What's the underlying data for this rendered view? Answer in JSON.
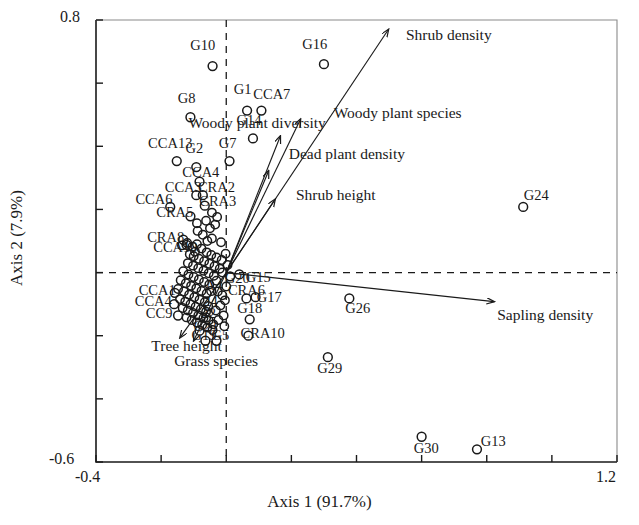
{
  "figure": {
    "type": "ordination-biplot",
    "background": "#ffffff",
    "ink": "#1a1a1a"
  },
  "axes": {
    "x": {
      "title": "Axis 1 (91.7%)",
      "min_label": "-0.4",
      "max_label": "1.2",
      "min": -0.4,
      "max": 1.2,
      "tick_step": 0.2,
      "ticks": [
        -0.4,
        -0.2,
        0.0,
        0.2,
        0.4,
        0.6,
        0.8,
        1.0,
        1.2
      ]
    },
    "y": {
      "title": "Axis 2 (7.9%)",
      "min_label": "-0.6",
      "max_label": "0.8",
      "min": -0.6,
      "max": 0.8,
      "tick_step": 0.2,
      "ticks": [
        -0.6,
        -0.4,
        -0.2,
        0.0,
        0.2,
        0.4,
        0.6,
        0.8
      ]
    },
    "reference_lines": {
      "vertical_at_x": 0.0,
      "horizontal_at_y": 0.0,
      "style": "dashed"
    }
  },
  "chart_data": {
    "type": "scatter",
    "title": "",
    "xlabel": "Axis 1 (91.7%)",
    "ylabel": "Axis 2 (7.9%)",
    "xlim": [
      -0.4,
      1.2
    ],
    "ylim": [
      -0.6,
      0.8
    ],
    "grid": false,
    "legend": "none",
    "marker": "open-circle",
    "points": [
      {
        "label": "G10",
        "x": -0.042,
        "y": 0.654,
        "lx": -0.072,
        "ly": 0.714,
        "anchor": "middle"
      },
      {
        "label": "G1",
        "x": 0.064,
        "y": 0.513,
        "lx": 0.05,
        "ly": 0.576,
        "anchor": "middle"
      },
      {
        "label": "CCA7",
        "x": 0.108,
        "y": 0.513,
        "lx": 0.14,
        "ly": 0.56,
        "anchor": "middle"
      },
      {
        "label": "G8",
        "x": -0.11,
        "y": 0.492,
        "lx": -0.122,
        "ly": 0.548,
        "anchor": "middle"
      },
      {
        "label": "G14",
        "x": 0.082,
        "y": 0.425,
        "lx": 0.07,
        "ly": 0.478,
        "anchor": "middle"
      },
      {
        "label": "G7",
        "x": 0.01,
        "y": 0.353,
        "lx": 0.004,
        "ly": 0.406,
        "anchor": "middle"
      },
      {
        "label": "CCA13",
        "x": -0.152,
        "y": 0.353,
        "lx": -0.172,
        "ly": 0.406,
        "anchor": "middle"
      },
      {
        "label": "G2",
        "x": -0.092,
        "y": 0.334,
        "lx": -0.098,
        "ly": 0.388,
        "anchor": "middle"
      },
      {
        "label": "CCA4",
        "x": -0.082,
        "y": 0.288,
        "lx": -0.078,
        "ly": 0.312,
        "anchor": "middle"
      },
      {
        "label": "CCA3",
        "x": -0.092,
        "y": 0.245,
        "lx": -0.132,
        "ly": 0.266,
        "anchor": "middle"
      },
      {
        "label": "CRA2",
        "x": -0.072,
        "y": 0.245,
        "lx": -0.03,
        "ly": 0.266,
        "anchor": "middle"
      },
      {
        "label": "CCA6",
        "x": -0.172,
        "y": 0.208,
        "lx": -0.222,
        "ly": 0.228,
        "anchor": "middle"
      },
      {
        "label": "CRA3",
        "x": -0.066,
        "y": 0.212,
        "lx": -0.026,
        "ly": 0.222,
        "anchor": "middle"
      },
      {
        "label": "CRA5",
        "x": -0.11,
        "y": 0.178,
        "lx": -0.158,
        "ly": 0.186,
        "anchor": "middle"
      },
      {
        "label": "CRA8",
        "x": -0.132,
        "y": 0.104,
        "lx": -0.186,
        "ly": 0.106,
        "anchor": "middle"
      },
      {
        "label": "CCA10",
        "x": -0.122,
        "y": 0.088,
        "lx": -0.156,
        "ly": 0.076,
        "anchor": "middle"
      },
      {
        "label": "G16",
        "x": 0.3,
        "y": 0.66,
        "lx": 0.272,
        "ly": 0.718,
        "anchor": "middle"
      },
      {
        "label": "G24",
        "x": 0.912,
        "y": 0.208,
        "lx": 0.952,
        "ly": 0.24,
        "anchor": "middle"
      },
      {
        "label": "G20",
        "x": 0.012,
        "y": -0.012,
        "lx": 0.034,
        "ly": -0.022,
        "anchor": "middle"
      },
      {
        "label": "G15",
        "x": 0.04,
        "y": -0.006,
        "lx": 0.098,
        "ly": -0.02,
        "anchor": "middle"
      },
      {
        "label": "CRA6",
        "x": 0.062,
        "y": -0.082,
        "lx": 0.062,
        "ly": -0.062,
        "anchor": "middle"
      },
      {
        "label": "G17",
        "x": 0.09,
        "y": -0.078,
        "lx": 0.132,
        "ly": -0.082,
        "anchor": "middle"
      },
      {
        "label": "G18",
        "x": 0.072,
        "y": -0.148,
        "lx": 0.072,
        "ly": -0.118,
        "anchor": "middle"
      },
      {
        "label": "CRA10",
        "x": 0.068,
        "y": -0.2,
        "lx": 0.112,
        "ly": -0.198,
        "anchor": "middle"
      },
      {
        "label": "G26",
        "x": 0.378,
        "y": -0.082,
        "lx": 0.404,
        "ly": -0.118,
        "anchor": "middle"
      },
      {
        "label": "G29",
        "x": 0.312,
        "y": -0.268,
        "lx": 0.318,
        "ly": -0.306,
        "anchor": "middle"
      },
      {
        "label": "G30",
        "x": 0.6,
        "y": -0.52,
        "lx": 0.614,
        "ly": -0.562,
        "anchor": "middle"
      },
      {
        "label": "G13",
        "x": 0.77,
        "y": -0.56,
        "lx": 0.82,
        "ly": -0.538,
        "anchor": "middle"
      },
      {
        "label": "CCA1",
        "x": -0.158,
        "y": -0.064,
        "lx": -0.212,
        "ly": -0.06,
        "anchor": "middle"
      },
      {
        "label": "CCA4b",
        "x": -0.16,
        "y": -0.1,
        "lx": -0.224,
        "ly": -0.096,
        "anchor": "middle"
      },
      {
        "label": "CC9",
        "x": -0.148,
        "y": -0.136,
        "lx": -0.206,
        "ly": -0.132,
        "anchor": "middle"
      },
      {
        "label": "A4",
        "x": -0.046,
        "y": -0.058,
        "lx": -0.038,
        "ly": -0.046,
        "anchor": "middle"
      },
      {
        "label": "24",
        "x": -0.056,
        "y": -0.106,
        "lx": -0.048,
        "ly": -0.096,
        "anchor": "middle"
      },
      {
        "label": "22",
        "x": -0.062,
        "y": -0.142,
        "lx": -0.054,
        "ly": -0.134,
        "anchor": "middle"
      },
      {
        "label": "G21",
        "x": -0.082,
        "y": -0.184,
        "lx": -0.062,
        "ly": -0.176,
        "anchor": "middle"
      },
      {
        "label": "G19",
        "x": -0.064,
        "y": -0.216,
        "lx": -0.068,
        "ly": -0.204,
        "anchor": "middle"
      },
      {
        "label": "G5",
        "x": -0.03,
        "y": -0.216,
        "lx": -0.018,
        "ly": -0.204,
        "anchor": "middle"
      }
    ],
    "cluster_points": [
      {
        "x": -0.136,
        "y": 0.086
      },
      {
        "x": -0.12,
        "y": 0.094
      },
      {
        "x": -0.104,
        "y": 0.082
      },
      {
        "x": -0.09,
        "y": 0.09
      },
      {
        "x": -0.076,
        "y": 0.076
      },
      {
        "x": -0.06,
        "y": 0.064
      },
      {
        "x": -0.046,
        "y": 0.056
      },
      {
        "x": -0.03,
        "y": 0.048
      },
      {
        "x": -0.014,
        "y": 0.04
      },
      {
        "x": -0.1,
        "y": 0.052
      },
      {
        "x": -0.084,
        "y": 0.044
      },
      {
        "x": -0.068,
        "y": 0.036
      },
      {
        "x": -0.052,
        "y": 0.028
      },
      {
        "x": -0.036,
        "y": 0.02
      },
      {
        "x": -0.02,
        "y": 0.012
      },
      {
        "x": -0.118,
        "y": 0.03
      },
      {
        "x": -0.102,
        "y": 0.022
      },
      {
        "x": -0.086,
        "y": 0.014
      },
      {
        "x": -0.07,
        "y": 0.006
      },
      {
        "x": -0.054,
        "y": -0.002
      },
      {
        "x": -0.038,
        "y": -0.01
      },
      {
        "x": -0.132,
        "y": 0.004
      },
      {
        "x": -0.116,
        "y": -0.006
      },
      {
        "x": -0.1,
        "y": -0.014
      },
      {
        "x": -0.084,
        "y": -0.022
      },
      {
        "x": -0.068,
        "y": -0.03
      },
      {
        "x": -0.052,
        "y": -0.038
      },
      {
        "x": -0.14,
        "y": -0.024
      },
      {
        "x": -0.124,
        "y": -0.034
      },
      {
        "x": -0.108,
        "y": -0.042
      },
      {
        "x": -0.092,
        "y": -0.05
      },
      {
        "x": -0.076,
        "y": -0.058
      },
      {
        "x": -0.06,
        "y": -0.066
      },
      {
        "x": -0.148,
        "y": -0.052
      },
      {
        "x": -0.13,
        "y": -0.06
      },
      {
        "x": -0.114,
        "y": -0.07
      },
      {
        "x": -0.098,
        "y": -0.078
      },
      {
        "x": -0.082,
        "y": -0.086
      },
      {
        "x": -0.066,
        "y": -0.094
      },
      {
        "x": -0.142,
        "y": -0.084
      },
      {
        "x": -0.126,
        "y": -0.092
      },
      {
        "x": -0.11,
        "y": -0.1
      },
      {
        "x": -0.094,
        "y": -0.108
      },
      {
        "x": -0.078,
        "y": -0.116
      },
      {
        "x": -0.062,
        "y": -0.124
      },
      {
        "x": -0.134,
        "y": -0.112
      },
      {
        "x": -0.118,
        "y": -0.12
      },
      {
        "x": -0.102,
        "y": -0.128
      },
      {
        "x": -0.086,
        "y": -0.136
      },
      {
        "x": -0.07,
        "y": -0.144
      },
      {
        "x": -0.054,
        "y": -0.152
      },
      {
        "x": -0.122,
        "y": -0.142
      },
      {
        "x": -0.106,
        "y": -0.15
      },
      {
        "x": -0.09,
        "y": -0.158
      },
      {
        "x": -0.074,
        "y": -0.166
      },
      {
        "x": -0.058,
        "y": -0.174
      },
      {
        "x": -0.042,
        "y": -0.182
      },
      {
        "x": -0.026,
        "y": -0.06
      },
      {
        "x": -0.012,
        "y": -0.072
      },
      {
        "x": -0.004,
        "y": -0.088
      },
      {
        "x": -0.018,
        "y": -0.104
      },
      {
        "x": -0.032,
        "y": -0.12
      },
      {
        "x": -0.008,
        "y": -0.136
      },
      {
        "x": -0.024,
        "y": -0.15
      },
      {
        "x": -0.04,
        "y": -0.164
      },
      {
        "x": -0.006,
        "y": -0.17
      },
      {
        "x": -0.112,
        "y": 0.058
      },
      {
        "x": -0.096,
        "y": 0.066
      },
      {
        "x": -0.058,
        "y": 0.1
      },
      {
        "x": -0.044,
        "y": 0.108
      },
      {
        "x": -0.072,
        "y": 0.12
      },
      {
        "x": -0.088,
        "y": 0.132
      },
      {
        "x": -0.05,
        "y": 0.14
      },
      {
        "x": -0.034,
        "y": 0.152
      },
      {
        "x": -0.062,
        "y": 0.164
      },
      {
        "x": -0.09,
        "y": 0.156
      },
      {
        "x": -0.028,
        "y": 0.176
      },
      {
        "x": -0.044,
        "y": 0.19
      },
      {
        "x": -0.016,
        "y": 0.096
      },
      {
        "x": -0.002,
        "y": 0.06
      },
      {
        "x": 0.004,
        "y": 0.024
      },
      {
        "x": -0.012,
        "y": 0.0
      },
      {
        "x": -0.03,
        "y": -0.026
      },
      {
        "x": 0.0,
        "y": -0.044
      }
    ],
    "vectors": [
      {
        "name": "Shrub density",
        "x": 0.498,
        "y": 0.77,
        "label_x": 0.552,
        "label_y": 0.748,
        "anchor": "start"
      },
      {
        "name": "Woody plant species",
        "x": 0.228,
        "y": 0.486,
        "label_x": 0.33,
        "label_y": 0.5,
        "anchor": "start"
      },
      {
        "name": "Woody plant diversity",
        "x": 0.166,
        "y": 0.432,
        "label_x": -0.116,
        "label_y": 0.468,
        "anchor": "start"
      },
      {
        "name": "Dead plant density",
        "x": 0.13,
        "y": 0.322,
        "label_x": 0.192,
        "label_y": 0.372,
        "anchor": "start"
      },
      {
        "name": "Shrub height",
        "x": 0.15,
        "y": 0.232,
        "label_x": 0.214,
        "label_y": 0.24,
        "anchor": "start"
      },
      {
        "name": "Sapling density",
        "x": 0.822,
        "y": -0.092,
        "label_x": 0.832,
        "label_y": -0.138,
        "anchor": "start"
      },
      {
        "name": "Tree height",
        "x": -0.142,
        "y": -0.206,
        "label_x": -0.23,
        "label_y": -0.238,
        "anchor": "start"
      },
      {
        "name": "Grass species",
        "x": -0.1,
        "y": -0.216,
        "label_x": -0.16,
        "label_y": -0.286,
        "anchor": "start"
      }
    ]
  },
  "labels": {
    "vector_names": [
      "Shrub density",
      "Woody plant species",
      "Woody plant diversity",
      "Dead plant density",
      "Shrub height",
      "Sapling density",
      "Tree height",
      "Grass species"
    ]
  }
}
